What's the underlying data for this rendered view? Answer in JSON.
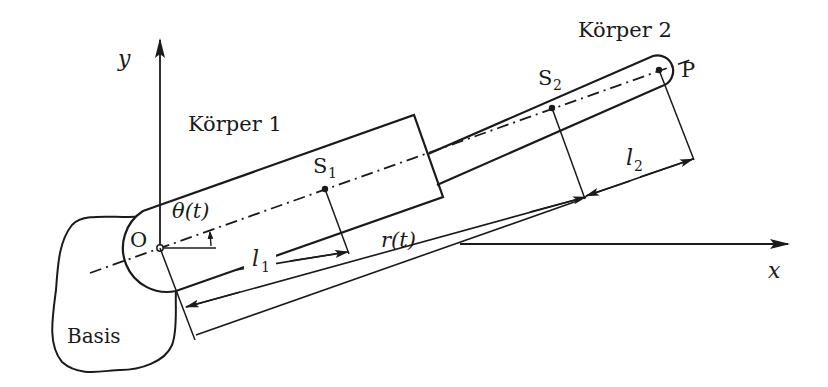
{
  "diagram": {
    "colors": {
      "stroke": "#1a1a1a",
      "background": "#ffffff"
    },
    "axes": {
      "x_label": "x",
      "y_label": "y"
    },
    "labels": {
      "origin": "O",
      "base": "Basis",
      "body1": "Körper 1",
      "body2": "Körper 2",
      "s1": "S",
      "s1_sub": "1",
      "s2": "S",
      "s2_sub": "2",
      "point_p": "P",
      "angle": "θ(t)",
      "l1": "l",
      "l1_sub": "1",
      "l2": "l",
      "l2_sub": "2",
      "r": "r(t)"
    },
    "nodes": [
      {
        "id": "O",
        "label": "O",
        "type": "joint"
      },
      {
        "id": "S1",
        "label": "S1",
        "type": "center-of-mass"
      },
      {
        "id": "S2",
        "label": "S2",
        "type": "center-of-mass"
      },
      {
        "id": "P",
        "label": "P",
        "type": "end-point"
      },
      {
        "id": "Basis",
        "label": "Basis",
        "type": "base"
      }
    ],
    "dimensions": [
      {
        "name": "l1",
        "from": "O",
        "to": "S1"
      },
      {
        "name": "r(t)",
        "from": "O",
        "to": "S2"
      },
      {
        "name": "l2",
        "from": "S2",
        "to": "P"
      },
      {
        "name": "θ(t)",
        "type": "angle",
        "between": [
          "x-axis",
          "arm-axis"
        ]
      }
    ]
  }
}
